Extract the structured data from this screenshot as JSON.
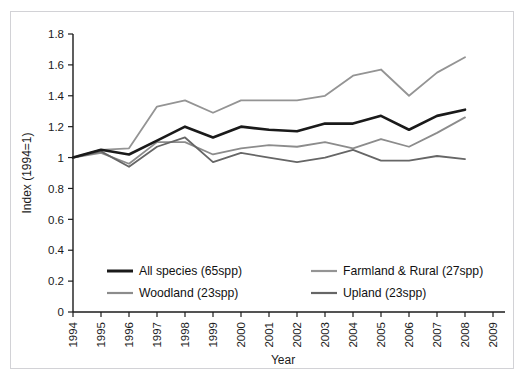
{
  "figure": {
    "top_cropped_text": "",
    "bottom_cropped_text": ""
  },
  "chart_data": {
    "type": "line",
    "title": "",
    "subtitle": "",
    "xlabel": "Year",
    "ylabel": "Index (1994=1)",
    "x": [
      1994,
      1995,
      1996,
      1997,
      1998,
      1999,
      2000,
      2001,
      2002,
      2003,
      2004,
      2005,
      2006,
      2007,
      2008
    ],
    "xtick_labels": [
      "1994",
      "1995",
      "1996",
      "1997",
      "1998",
      "1999",
      "2000",
      "2001",
      "2002",
      "2003",
      "2004",
      "2005",
      "2006",
      "2007",
      "2008",
      "2009"
    ],
    "xtick_values": [
      1994,
      1995,
      1996,
      1997,
      1998,
      1999,
      2000,
      2001,
      2002,
      2003,
      2004,
      2005,
      2006,
      2007,
      2008,
      2009
    ],
    "xtick_rotation": -90,
    "xlim": [
      1994,
      2009
    ],
    "ylim": [
      0,
      1.8
    ],
    "ytick_labels": [
      "0",
      "0.2",
      "0.4",
      "0.6",
      "0.8",
      "1",
      "1.2",
      "1.4",
      "1.6",
      "1.8"
    ],
    "ytick_values": [
      0,
      0.2,
      0.4,
      0.6,
      0.8,
      1.0,
      1.2,
      1.4,
      1.6,
      1.8
    ],
    "grid": false,
    "legend_position": "inside lower-left, two columns",
    "series": [
      {
        "name": "All species (65spp)",
        "color": "#1a1a1a",
        "width": 2.6,
        "values": [
          1.0,
          1.05,
          1.02,
          1.11,
          1.2,
          1.13,
          1.2,
          1.18,
          1.17,
          1.22,
          1.22,
          1.27,
          1.18,
          1.27,
          1.31
        ]
      },
      {
        "name": "Woodland (23spp)",
        "color": "#8c8c8c",
        "width": 1.8,
        "values": [
          1.0,
          1.03,
          0.96,
          1.1,
          1.1,
          1.02,
          1.06,
          1.08,
          1.07,
          1.1,
          1.06,
          1.12,
          1.07,
          1.16,
          1.26
        ]
      },
      {
        "name": "Farmland & Rural (27spp)",
        "color": "#949494",
        "width": 1.8,
        "values": [
          1.0,
          1.05,
          1.06,
          1.33,
          1.37,
          1.29,
          1.37,
          1.37,
          1.37,
          1.4,
          1.53,
          1.57,
          1.4,
          1.55,
          1.65
        ]
      },
      {
        "name": "Upland (23spp)",
        "color": "#666666",
        "width": 1.8,
        "values": [
          1.0,
          1.04,
          0.94,
          1.07,
          1.13,
          0.97,
          1.03,
          1.0,
          0.97,
          1.0,
          1.05,
          0.98,
          0.98,
          1.01,
          0.99
        ]
      }
    ],
    "legend_entries": [
      {
        "label": "All species (65spp)",
        "color": "#1a1a1a",
        "width": 3.0
      },
      {
        "label": "Farmland & Rural (27spp)",
        "color": "#949494",
        "width": 2.2
      },
      {
        "label": "Woodland (23spp)",
        "color": "#8c8c8c",
        "width": 2.2
      },
      {
        "label": "Upland (23spp)",
        "color": "#666666",
        "width": 2.2
      }
    ]
  }
}
